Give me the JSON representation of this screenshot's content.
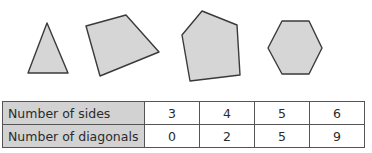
{
  "shapes": [
    {
      "name": "triangle",
      "sides": 3,
      "points": "47,23 68,73 28,73"
    },
    {
      "name": "quadrilateral",
      "sides": 4,
      "points": "86,26 126,15 159,52 100,76"
    },
    {
      "name": "pentagon",
      "sides": 5,
      "points": "202,11 237,25 240,75 190,81 182,35"
    },
    {
      "name": "hexagon",
      "sides": 6,
      "points": "282,21 309,21 322,48 309,74 282,74 268,48"
    }
  ],
  "table": {
    "rows": [
      {
        "label": "Number of sides",
        "values": [
          "3",
          "4",
          "5",
          "6"
        ]
      },
      {
        "label": "Number of diagonals",
        "values": [
          "0",
          "2",
          "5",
          "9"
        ]
      }
    ]
  },
  "chart_data": {
    "type": "table",
    "title": "",
    "columns": [
      "Number of sides",
      "Number of diagonals"
    ],
    "rows": [
      [
        3,
        0
      ],
      [
        4,
        2
      ],
      [
        5,
        5
      ],
      [
        6,
        9
      ]
    ]
  }
}
